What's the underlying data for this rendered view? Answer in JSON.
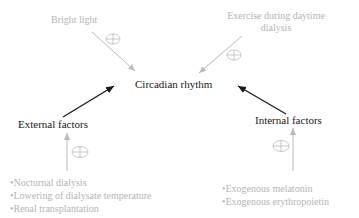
{
  "center": {
    "label": "Circadian rhythm"
  },
  "top_left": {
    "label": "Bright light",
    "sign": "+"
  },
  "top_right": {
    "line1": "Exercise during daytime",
    "line2": "dialysis",
    "sign": "+"
  },
  "external": {
    "label": "External factors",
    "sign": "+",
    "items": [
      "•Nocturnal dialysis",
      "•Lowering of dialysate temperature",
      "•Renal transplantation"
    ]
  },
  "internal": {
    "label": "Internal factors",
    "sign": "+",
    "items": [
      "•Exogenous melatonin",
      "•Exogenous erythropoietin"
    ]
  },
  "colors": {
    "grey": "#b5b5b5",
    "dark": "#1a1a1a"
  }
}
